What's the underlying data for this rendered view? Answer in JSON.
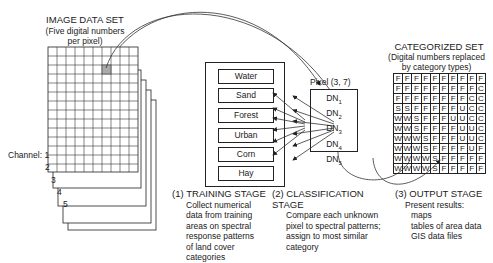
{
  "image_data_set": {
    "title": "IMAGE DATA SET",
    "subtitle_line1": "(Five digital numbers",
    "subtitle_line2": "per pixel)",
    "channel_label": "Channel: 1",
    "channels": [
      "2",
      "3",
      "4",
      "5"
    ],
    "grid_size": 10,
    "highlighted_pixel": {
      "row": 3,
      "col": 7
    }
  },
  "training": {
    "categories": [
      "Water",
      "Sand",
      "Forest",
      "Urban",
      "Corn",
      "Hay"
    ],
    "stage_number": "(1)",
    "stage_title": "TRAINING STAGE",
    "stage_lines": [
      "Collect numerical",
      "data from training",
      "areas on spectral",
      "response patterns",
      "of land cover",
      "categories"
    ]
  },
  "classification": {
    "pixel_label": "Pixel (3, 7)",
    "dn_labels": [
      {
        "base": "DN",
        "sub": "1"
      },
      {
        "base": "DN",
        "sub": "2"
      },
      {
        "base": "DN",
        "sub": "3"
      },
      {
        "base": "DN",
        "sub": "4"
      },
      {
        "base": "DN",
        "sub": "5"
      }
    ],
    "stage_number": "(2)",
    "stage_title": "CLASSIFICATION STAGE",
    "stage_lines": [
      "Compare each unknown",
      "pixel to spectral patterns;",
      "assign to most similar",
      "category"
    ]
  },
  "categorized_set": {
    "title": "CATEGORIZED SET",
    "subtitle_line1": "(Digital numbers replaced",
    "subtitle_line2": "by category types)",
    "grid": [
      [
        "F",
        "F",
        "F",
        "F",
        "F",
        "F",
        "F",
        "F",
        "F",
        "F"
      ],
      [
        "F",
        "F",
        "F",
        "F",
        "F",
        "F",
        "F",
        "F",
        "F",
        "C"
      ],
      [
        "F",
        "F",
        "F",
        "F",
        "F",
        "F",
        "F",
        "F",
        "C",
        "C"
      ],
      [
        "S",
        "S",
        "F",
        "F",
        "F",
        "F",
        "F",
        "U",
        "C",
        "C"
      ],
      [
        "W",
        "W",
        "S",
        "F",
        "F",
        "F",
        "U",
        "U",
        "C",
        "C"
      ],
      [
        "W",
        "W",
        "S",
        "F",
        "F",
        "F",
        "F",
        "U",
        "U",
        "C"
      ],
      [
        "W",
        "W",
        "W",
        "S",
        "F",
        "F",
        "F",
        "U",
        "U",
        "C"
      ],
      [
        "W",
        "W",
        "W",
        "S",
        "F",
        "F",
        "F",
        "F",
        "U",
        "F"
      ],
      [
        "W",
        "W",
        "W",
        "W",
        "S",
        "F",
        "F",
        "F",
        "F",
        "F"
      ],
      [
        "W",
        "W",
        "W",
        "W",
        "S",
        "F",
        "F",
        "F",
        "F",
        "F"
      ]
    ]
  },
  "output": {
    "stage_number": "(3)",
    "stage_title": "OUTPUT STAGE",
    "intro": "Present results:",
    "items": [
      "maps",
      "tables of area data",
      "GIS data files"
    ]
  }
}
